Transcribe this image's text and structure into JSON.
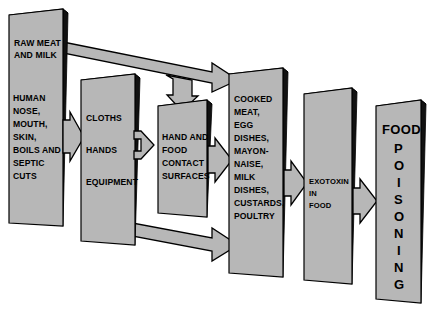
{
  "diagram": {
    "colors": {
      "box_face": "#b7b7b7",
      "box_shadow": "#111111",
      "arrow_fill": "#b7b7b7",
      "outline": "#000000",
      "background": "#ffffff",
      "text": "#000000"
    },
    "nodes": [
      {
        "id": "raw-meat-and-milk",
        "name": "raw-meat-and-milk-box",
        "lines": [
          "RAW MEAT",
          "AND MILK"
        ]
      },
      {
        "id": "human-sources",
        "name": "human-sources-box",
        "lines": [
          "HUMAN",
          "NOSE,",
          "MOUTH,",
          "SKIN,",
          "BOILS AND",
          "SEPTIC",
          "CUTS"
        ]
      },
      {
        "id": "cloths-hands-equipment",
        "name": "cloths-hands-equipment-box",
        "lines": [
          "CLOTHS",
          "",
          "HANDS",
          "",
          "EQUIPMENT"
        ]
      },
      {
        "id": "hand-and-food-contact-surfaces",
        "name": "hand-and-food-contact-surfaces-box",
        "lines": [
          "HAND AND",
          "FOOD",
          "CONTACT",
          "SURFACES"
        ]
      },
      {
        "id": "cooked-foods",
        "name": "cooked-foods-box",
        "lines": [
          "COOKED",
          "MEAT,",
          "EGG",
          "DISHES,",
          "MAYON-",
          "NAISE,",
          "MILK",
          "DISHES,",
          "CUSTARDS,",
          "POULTRY"
        ]
      },
      {
        "id": "exotoxin-in-food",
        "name": "exotoxin-in-food-box",
        "lines": [
          "EXOTOXIN",
          "IN",
          "FOOD"
        ]
      },
      {
        "id": "food-poisoning",
        "name": "food-poisoning-box",
        "lines": [
          "FOOD",
          "P",
          "O",
          "I",
          "S",
          "O",
          "N",
          "I",
          "N",
          "G"
        ]
      }
    ],
    "edges": [
      {
        "id": "human-to-cloths",
        "name": "arrow-human-sources-to-cloths",
        "from": "human-sources",
        "to": "cloths-hands-equipment",
        "style": "single"
      },
      {
        "id": "cloths-to-surfaces",
        "name": "arrow-cloths-to-contact-surfaces",
        "from": "cloths-hands-equipment",
        "to": "hand-and-food-contact-surfaces",
        "style": "double"
      },
      {
        "id": "rawmeat-to-cooked",
        "name": "arrow-raw-meat-to-cooked-foods",
        "from": "raw-meat-and-milk",
        "to": "cooked-foods",
        "style": "single-diagonal"
      },
      {
        "id": "rawmeat-to-surfaces",
        "name": "arrow-raw-meat-branch-to-contact-surfaces",
        "from": "raw-meat-and-milk",
        "to": "hand-and-food-contact-surfaces",
        "style": "branch-down"
      },
      {
        "id": "surfaces-to-cooked",
        "name": "arrow-contact-surfaces-to-cooked-foods",
        "from": "hand-and-food-contact-surfaces",
        "to": "cooked-foods",
        "style": "single"
      },
      {
        "id": "cloths-to-cooked",
        "name": "arrow-cloths-to-cooked-foods",
        "from": "cloths-hands-equipment",
        "to": "cooked-foods",
        "style": "single-diagonal"
      },
      {
        "id": "cooked-to-exotoxin",
        "name": "arrow-cooked-foods-to-exotoxin",
        "from": "cooked-foods",
        "to": "exotoxin-in-food",
        "style": "single"
      },
      {
        "id": "exotoxin-to-poisoning",
        "name": "arrow-exotoxin-to-food-poisoning",
        "from": "exotoxin-in-food",
        "to": "food-poisoning",
        "style": "single"
      }
    ]
  }
}
